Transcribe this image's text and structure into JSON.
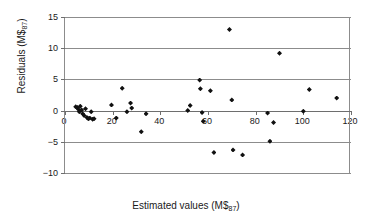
{
  "chart_data": {
    "type": "scatter",
    "title": "",
    "xlabel": "Estimated values (M$87)",
    "xlabel_base": "Estimated values (M$",
    "xlabel_sub": "87",
    "xlabel_tail": ")",
    "ylabel": "Residuals (M$87)",
    "ylabel_base": "Residuals (M$",
    "ylabel_sub": "87",
    "ylabel_tail": ")",
    "xlim": [
      0,
      120
    ],
    "ylim": [
      -10,
      15
    ],
    "xticks": [
      0,
      20,
      40,
      60,
      80,
      100,
      120
    ],
    "yticks": [
      -10,
      -5,
      0,
      5,
      10,
      15
    ],
    "xtick_labels": [
      "0",
      "20",
      "40",
      "60",
      "80",
      "100",
      "120"
    ],
    "ytick_labels": [
      "-10",
      "-5",
      "0",
      "5",
      "10",
      "15"
    ],
    "grid": "horizontal",
    "legend": "none",
    "marker": "diamond",
    "marker_color": "#111111",
    "grid_color": "#8c8c8c",
    "background": "#ffffff",
    "points": [
      {
        "x": 4.5,
        "y": 0.6
      },
      {
        "x": 5.2,
        "y": 0.5
      },
      {
        "x": 5.6,
        "y": 0.2
      },
      {
        "x": 6.0,
        "y": -0.2
      },
      {
        "x": 6.4,
        "y": 0.7
      },
      {
        "x": 7.0,
        "y": 0.1
      },
      {
        "x": 7.4,
        "y": -0.5
      },
      {
        "x": 8.0,
        "y": -0.8
      },
      {
        "x": 8.6,
        "y": 0.3
      },
      {
        "x": 9.2,
        "y": -1.1
      },
      {
        "x": 9.8,
        "y": -1.3
      },
      {
        "x": 10.4,
        "y": -1.2
      },
      {
        "x": 11.0,
        "y": -0.2
      },
      {
        "x": 11.6,
        "y": -1.4
      },
      {
        "x": 12.2,
        "y": -1.3
      },
      {
        "x": 19.5,
        "y": 0.9
      },
      {
        "x": 21.5,
        "y": -1.2
      },
      {
        "x": 24.0,
        "y": 3.6
      },
      {
        "x": 26.0,
        "y": -0.2
      },
      {
        "x": 27.5,
        "y": 1.2
      },
      {
        "x": 28.0,
        "y": 0.4
      },
      {
        "x": 32.0,
        "y": -3.4
      },
      {
        "x": 34.0,
        "y": -0.5
      },
      {
        "x": 51.5,
        "y": 0.0
      },
      {
        "x": 52.5,
        "y": 0.8
      },
      {
        "x": 56.5,
        "y": 4.9
      },
      {
        "x": 56.8,
        "y": 3.5
      },
      {
        "x": 57.5,
        "y": -0.3
      },
      {
        "x": 58.0,
        "y": -1.7
      },
      {
        "x": 61.0,
        "y": 3.2
      },
      {
        "x": 62.5,
        "y": -6.7
      },
      {
        "x": 69.0,
        "y": 13.0
      },
      {
        "x": 70.0,
        "y": 1.7
      },
      {
        "x": 70.5,
        "y": -6.3
      },
      {
        "x": 74.5,
        "y": -7.1
      },
      {
        "x": 85.0,
        "y": -0.4
      },
      {
        "x": 86.0,
        "y": -4.9
      },
      {
        "x": 87.5,
        "y": -1.9
      },
      {
        "x": 90.0,
        "y": 9.2
      },
      {
        "x": 100.0,
        "y": -0.1
      },
      {
        "x": 102.5,
        "y": 3.4
      },
      {
        "x": 114.0,
        "y": 2.0
      }
    ]
  }
}
